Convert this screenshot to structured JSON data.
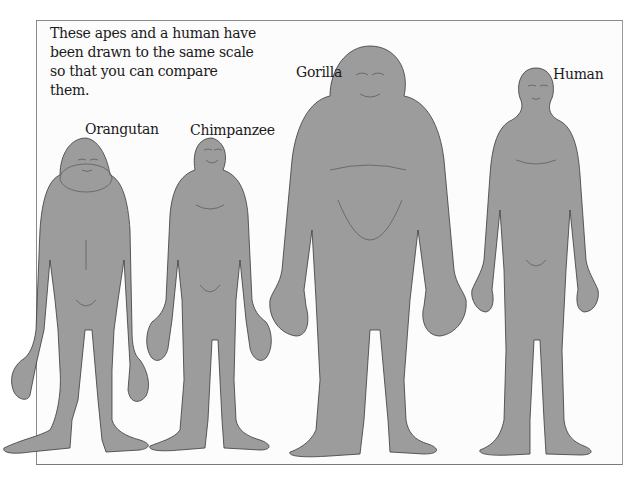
{
  "caption": "These apes and a human have been drawn to the same scale so that you can compare them.",
  "labels": {
    "orangutan": "Orangutan",
    "chimpanzee": "Chimpanzee",
    "gorilla": "Gorilla",
    "human": "Human"
  },
  "colors": {
    "figure_fill": "#9c9c9c",
    "outline": "#3a3a3a",
    "frame": "#8a8a8a",
    "text": "#1a1a1a"
  }
}
